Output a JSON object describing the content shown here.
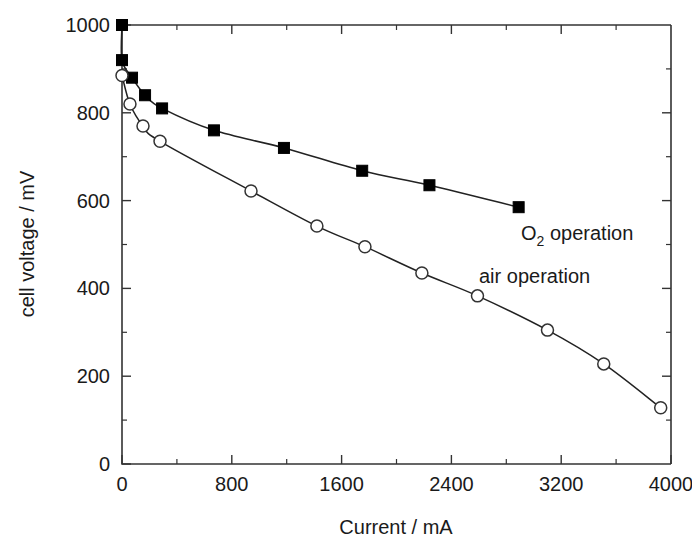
{
  "chart_data": {
    "type": "line",
    "title": "",
    "xlabel": "Current / mA",
    "ylabel": "cell voltage / mV",
    "xlim": [
      0,
      4000
    ],
    "ylim": [
      0,
      1000
    ],
    "xticks": [
      0,
      800,
      1600,
      2400,
      3200,
      4000
    ],
    "xticklabels": [
      "0",
      "800",
      "1600",
      "2400",
      "3200",
      "4000"
    ],
    "xminorticks": [
      400,
      1200,
      2000,
      2800,
      3600
    ],
    "yticks": [
      0,
      200,
      400,
      600,
      800,
      1000
    ],
    "yticklabels": [
      "0",
      "200",
      "400",
      "600",
      "800",
      "1000"
    ],
    "yminorticks": [
      100,
      300,
      500,
      700,
      900
    ],
    "grid": false,
    "legend_position": "inline-annotation",
    "series": [
      {
        "name": "O2 operation",
        "label_html": "O<sub>2</sub> operation",
        "marker": "filled-square",
        "color": "#000000",
        "points": [
          {
            "x": 0,
            "y": 1000
          },
          {
            "x": 0,
            "y": 920
          },
          {
            "x": 73,
            "y": 880
          },
          {
            "x": 168,
            "y": 840
          },
          {
            "x": 292,
            "y": 810
          },
          {
            "x": 670,
            "y": 760
          },
          {
            "x": 1180,
            "y": 720
          },
          {
            "x": 1750,
            "y": 668
          },
          {
            "x": 2240,
            "y": 635
          },
          {
            "x": 2890,
            "y": 585
          }
        ]
      },
      {
        "name": "air operation",
        "label_html": "air operation",
        "marker": "open-circle",
        "color": "#333333",
        "points": [
          {
            "x": 0,
            "y": 885
          },
          {
            "x": 58,
            "y": 820
          },
          {
            "x": 153,
            "y": 770
          },
          {
            "x": 277,
            "y": 735
          },
          {
            "x": 940,
            "y": 622
          },
          {
            "x": 1420,
            "y": 542
          },
          {
            "x": 1770,
            "y": 495
          },
          {
            "x": 2185,
            "y": 435
          },
          {
            "x": 2590,
            "y": 383
          },
          {
            "x": 3100,
            "y": 305
          },
          {
            "x": 3510,
            "y": 228
          },
          {
            "x": 3925,
            "y": 128
          }
        ]
      }
    ],
    "annotations": [
      {
        "text": "O2 operation",
        "x": 2950,
        "y": 545
      },
      {
        "text": "air operation",
        "x": 2610,
        "y": 470
      }
    ]
  },
  "labels": {
    "o2_prefix": "O",
    "o2_subscript": "2",
    "o2_suffix": " operation",
    "air": "air operation",
    "xaxis": "Current / mA",
    "yaxis": "cell voltage / mV"
  }
}
